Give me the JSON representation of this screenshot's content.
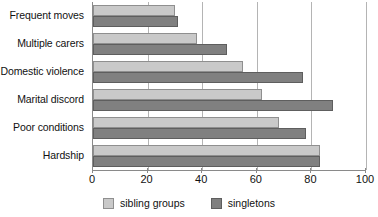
{
  "chart_data": {
    "type": "bar",
    "orientation": "horizontal",
    "title": "",
    "xlabel": "",
    "ylabel": "",
    "xlim": [
      0,
      100
    ],
    "xticks": [
      0,
      20,
      40,
      60,
      80,
      100
    ],
    "grid": true,
    "legend_position": "bottom",
    "categories": [
      "Frequent moves",
      "Multiple carers",
      "Domestic violence",
      "Marital discord",
      "Poor conditions",
      "Hardship"
    ],
    "series": [
      {
        "name": "sibling groups",
        "color": "#c9c9c9",
        "values": [
          30,
          38,
          55,
          62,
          68,
          83
        ]
      },
      {
        "name": "singletons",
        "color": "#808080",
        "values": [
          31,
          49,
          77,
          88,
          78,
          83
        ]
      }
    ]
  },
  "axis": {
    "tick_labels": [
      "0",
      "20",
      "40",
      "60",
      "80",
      "100"
    ]
  },
  "legend": {
    "items": [
      {
        "label": "sibling groups",
        "swatch": "light"
      },
      {
        "label": "singletons",
        "swatch": "dark"
      }
    ]
  }
}
